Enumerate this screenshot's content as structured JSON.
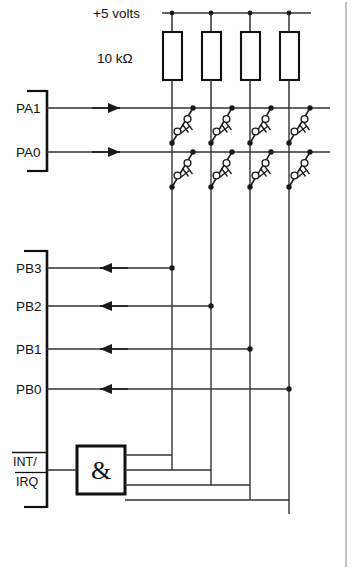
{
  "diagram": {
    "supply_label": "+5 volts",
    "resistor_label": "10 kΩ",
    "gate_symbol": "&",
    "port_a_pins": [
      "PA1",
      "PA0"
    ],
    "port_b_pins": [
      "PB3",
      "PB2",
      "PB1",
      "PB0"
    ],
    "interrupt_label_top": "INT/",
    "interrupt_label_bottom": "IRQ",
    "colors": {
      "line": "#333333",
      "ink": "#111111",
      "border": "#9a9a9a",
      "background": "#ffffff"
    },
    "counts": {
      "pullup_resistors": 4,
      "columns": 4,
      "rows": 2,
      "switches": 8
    }
  }
}
